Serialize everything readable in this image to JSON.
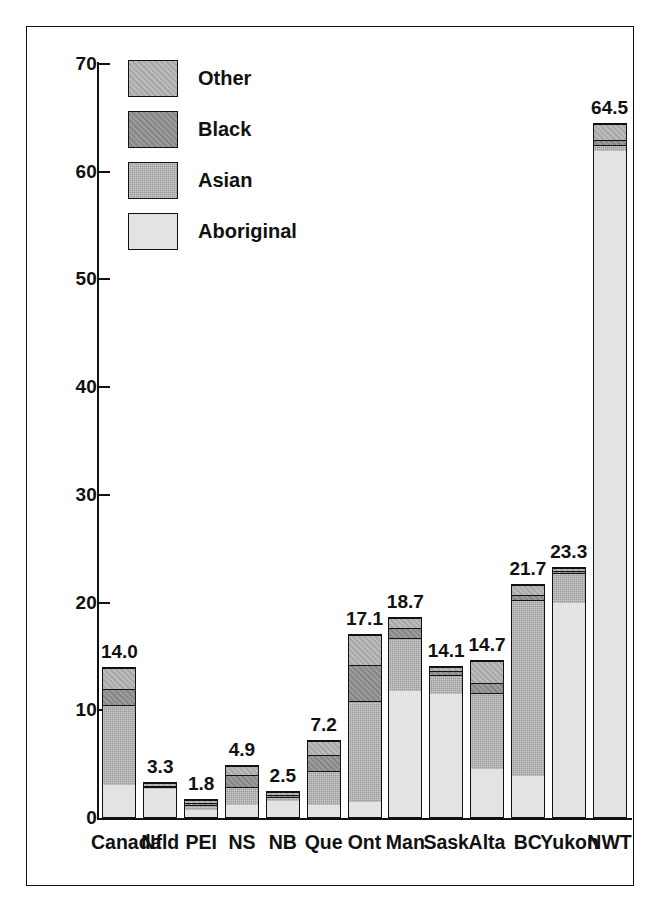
{
  "chart_data": {
    "type": "bar",
    "subtype": "stacked-bar",
    "title": "",
    "subtitle": "",
    "xlabel": "",
    "ylabel": "",
    "ylim": [
      0,
      70
    ],
    "ytick_step": 10,
    "ytick_labels": [
      "70",
      "60",
      "50",
      "40",
      "30",
      "20",
      "10",
      "0"
    ],
    "ytick_values": [
      70,
      60,
      50,
      40,
      30,
      20,
      10,
      0
    ],
    "grid": false,
    "legend_position": "top-left",
    "legend_order_top_to_bottom": [
      "Other",
      "Black",
      "Asian",
      "Aboriginal"
    ],
    "stack_order_bottom_to_top": [
      "Aboriginal",
      "Asian",
      "Black",
      "Other"
    ],
    "categories": [
      "Canada",
      "Nfld",
      "PEI",
      "NS",
      "NB",
      "Que",
      "Ont",
      "Man",
      "Sask",
      "Alta",
      "BC",
      "Yukon",
      "NWT"
    ],
    "series": [
      {
        "name": "Aboriginal",
        "color": "#e3e3e1",
        "values": [
          3.0,
          2.8,
          0.7,
          1.2,
          1.6,
          1.1,
          1.4,
          11.8,
          11.6,
          4.5,
          3.8,
          20.0,
          62.0
        ]
      },
      {
        "name": "Asian",
        "color": "#9a9a9a",
        "values": [
          7.5,
          0.2,
          0.5,
          1.7,
          0.4,
          3.3,
          9.5,
          5.0,
          1.8,
          7.2,
          16.5,
          2.8,
          0.6
        ]
      },
      {
        "name": "Black",
        "color": "#8d8d8d",
        "values": [
          1.5,
          0.1,
          0.3,
          1.2,
          0.2,
          1.5,
          3.4,
          0.9,
          0.3,
          0.9,
          0.5,
          0.2,
          0.4
        ]
      },
      {
        "name": "Other",
        "color": "#aeaeae",
        "values": [
          2.0,
          0.2,
          0.3,
          0.8,
          0.3,
          1.3,
          2.8,
          1.0,
          0.4,
          2.1,
          0.9,
          0.3,
          1.5
        ]
      }
    ],
    "totals": [
      14.0,
      3.3,
      1.8,
      4.9,
      2.5,
      7.2,
      17.1,
      18.7,
      14.1,
      14.7,
      21.7,
      23.3,
      64.5
    ],
    "total_labels": [
      "14.0",
      "3.3",
      "1.8",
      "4.9",
      "2.5",
      "7.2",
      "17.1",
      "18.7",
      "14.1",
      "14.7",
      "21.7",
      "23.3",
      "64.5"
    ]
  },
  "legend": {
    "items": [
      {
        "label": "Other",
        "fill_class": "f-other"
      },
      {
        "label": "Black",
        "fill_class": "f-black"
      },
      {
        "label": "Asian",
        "fill_class": "f-asian"
      },
      {
        "label": "Aboriginal",
        "fill_class": "f-aboriginal"
      }
    ]
  }
}
